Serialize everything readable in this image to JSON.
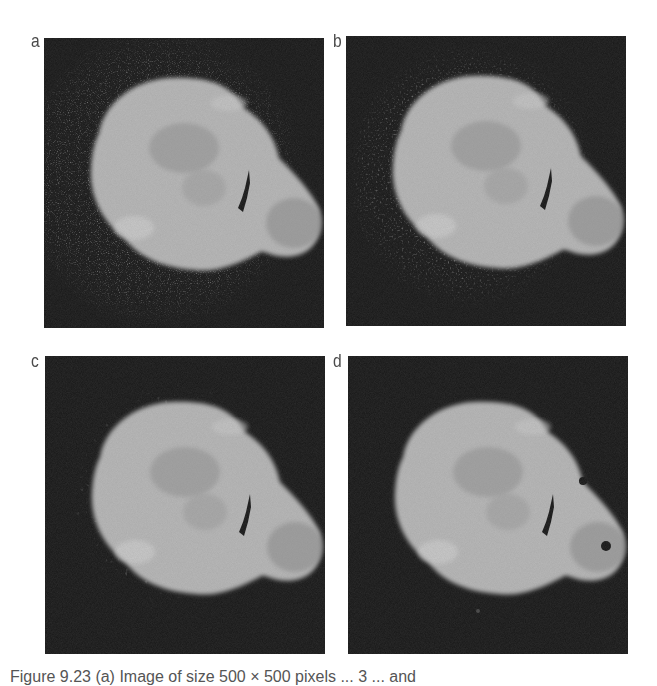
{
  "figure": {
    "panels": [
      {
        "label": "a",
        "description": "noisy nebula image, heavy background noise"
      },
      {
        "label": "b",
        "description": "filtered image, reduced noise"
      },
      {
        "label": "c",
        "description": "filtered image, further reduced noise, blocky halo"
      },
      {
        "label": "d",
        "description": "filtered image, smoothest, mostly clean background"
      }
    ],
    "caption": "Figure 9.23  (a) Image of size 500 × 500 pixels ... 3 ... and"
  },
  "colors": {
    "background": "#151515",
    "blob": "#b8b8b8",
    "blob_dark": "#8a8a8a",
    "crack": "#111111"
  }
}
